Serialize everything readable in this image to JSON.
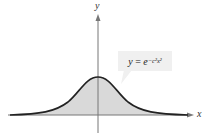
{
  "diagram": {
    "x_axis_label": "x",
    "y_axis_label": "y",
    "equation": {
      "lhs": "y",
      "equals": " = ",
      "base": "e",
      "exponent": "−c²x²"
    },
    "colors": {
      "curve": "#222222",
      "fill": "#d9d9d9",
      "axis": "#777777",
      "label_box": "#f0f0f0"
    }
  }
}
